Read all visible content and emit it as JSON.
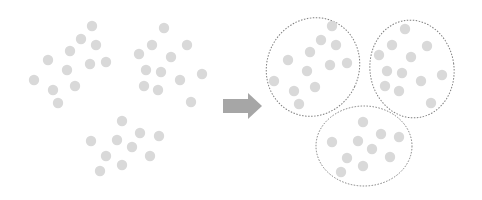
{
  "diagram": {
    "colors": {
      "dot": "#d9d9d9",
      "arrow": "#a6a6a6",
      "ellipse_stroke": "#7f7f7f",
      "background": "#ffffff"
    },
    "dot_radius": 5.2,
    "left_panel": {
      "points": [
        [
          92,
          26
        ],
        [
          81,
          39
        ],
        [
          96,
          45
        ],
        [
          70,
          51
        ],
        [
          48,
          60
        ],
        [
          67,
          70
        ],
        [
          90,
          64
        ],
        [
          106,
          62
        ],
        [
          34,
          80
        ],
        [
          53,
          90
        ],
        [
          75,
          86
        ],
        [
          58,
          103
        ],
        [
          164,
          28
        ],
        [
          152,
          45
        ],
        [
          187,
          45
        ],
        [
          139,
          54
        ],
        [
          171,
          57
        ],
        [
          146,
          70
        ],
        [
          161,
          72
        ],
        [
          180,
          80
        ],
        [
          202,
          74
        ],
        [
          144,
          86
        ],
        [
          158,
          90
        ],
        [
          191,
          102
        ],
        [
          122,
          121
        ],
        [
          140,
          133
        ],
        [
          159,
          136
        ],
        [
          91,
          141
        ],
        [
          117,
          140
        ],
        [
          132,
          147
        ],
        [
          106,
          156
        ],
        [
          150,
          156
        ],
        [
          122,
          165
        ],
        [
          100,
          171
        ]
      ]
    },
    "arrow": {
      "body": {
        "x": 223,
        "y": 99,
        "w": 26,
        "h": 14
      },
      "head": [
        [
          248,
          93
        ],
        [
          262,
          106
        ],
        [
          248,
          119
        ]
      ]
    },
    "right_panel": {
      "clusters": [
        {
          "name": "cluster-1",
          "ellipse": {
            "cx": 313,
            "cy": 67,
            "rx": 46,
            "ry": 50,
            "rotate": 25
          },
          "points": [
            [
              332,
              26
            ],
            [
              321,
              40
            ],
            [
              336,
              45
            ],
            [
              310,
              52
            ],
            [
              288,
              60
            ],
            [
              307,
              71
            ],
            [
              330,
              65
            ],
            [
              347,
              63
            ],
            [
              274,
              81
            ],
            [
              294,
              91
            ],
            [
              315,
              87
            ],
            [
              299,
              104
            ]
          ]
        },
        {
          "name": "cluster-2",
          "ellipse": {
            "cx": 412,
            "cy": 69,
            "rx": 42,
            "ry": 49,
            "rotate": -8
          },
          "points": [
            [
              405,
              29
            ],
            [
              392,
              45
            ],
            [
              427,
              46
            ],
            [
              379,
              55
            ],
            [
              411,
              57
            ],
            [
              387,
              71
            ],
            [
              402,
              73
            ],
            [
              421,
              81
            ],
            [
              442,
              75
            ],
            [
              385,
              86
            ],
            [
              399,
              91
            ],
            [
              431,
              103
            ]
          ]
        },
        {
          "name": "cluster-3",
          "ellipse": {
            "cx": 364,
            "cy": 146,
            "rx": 48,
            "ry": 40,
            "rotate": 0
          },
          "points": [
            [
              363,
              122
            ],
            [
              381,
              134
            ],
            [
              399,
              137
            ],
            [
              332,
              142
            ],
            [
              358,
              141
            ],
            [
              372,
              149
            ],
            [
              347,
              158
            ],
            [
              390,
              157
            ],
            [
              363,
              166
            ],
            [
              341,
              172
            ]
          ]
        }
      ]
    }
  }
}
